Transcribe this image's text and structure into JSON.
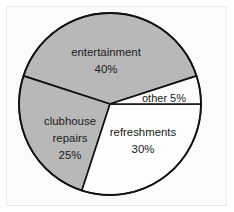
{
  "figure": {
    "background_color": "#ffffff",
    "frame_color": "#ededed"
  },
  "chart_data": {
    "type": "pie",
    "title": "",
    "subtitle": "",
    "xlabel": "",
    "ylabel": "",
    "legend_position": "none",
    "grid": false,
    "labels_inside_slices": true,
    "start_angle_deg": 0,
    "direction": "clockwise",
    "center": {
      "cx": 110,
      "cy": 104,
      "r": 91
    },
    "categories": [
      "refreshments",
      "clubhouse repairs",
      "entertainment",
      "other"
    ],
    "values": [
      30,
      25,
      40,
      5
    ],
    "units": "percent",
    "total": 100,
    "slices": [
      {
        "name": "refreshments",
        "label_line1": "refreshments",
        "label_line2": "30%",
        "value": 30,
        "percent_text": "30%",
        "fill": "#fdfdfd",
        "stroke": "#111111",
        "start_deg": 0,
        "end_deg": 108,
        "label_x": 142,
        "label_y": 139
      },
      {
        "name": "clubhouse repairs",
        "label_line1": "clubhouse",
        "label_line2": "repairs",
        "label_line3": "25%",
        "value": 25,
        "percent_text": "25%",
        "fill": "#b8b8b8",
        "stroke": "#111111",
        "start_deg": 108,
        "end_deg": 198,
        "label_x": 70,
        "label_y": 132
      },
      {
        "name": "entertainment",
        "label_line1": "entertainment",
        "label_line2": "40%",
        "value": 40,
        "percent_text": "40%",
        "fill": "#b8b8b8",
        "stroke": "#111111",
        "start_deg": 198,
        "end_deg": 342,
        "label_x": 106,
        "label_y": 53
      },
      {
        "name": "other",
        "label_line1": "other 5%",
        "value": 5,
        "percent_text": "5%",
        "fill": "#fdfdfd",
        "stroke": "#111111",
        "start_deg": 342,
        "end_deg": 360,
        "label_x": 163,
        "label_y": 98
      }
    ]
  }
}
